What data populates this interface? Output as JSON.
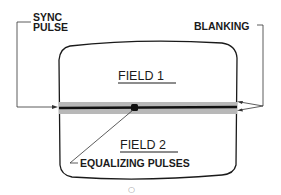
{
  "diagram": {
    "type": "tv-raster-field-diagram",
    "labels": {
      "sync_pulse_line1": "SYNC",
      "sync_pulse_line2": "PULSE",
      "blanking": "BLANKING",
      "field1": "FIELD 1",
      "field2": "FIELD 2",
      "equalizing_pulses": "EQUALIZING PULSES",
      "page_mark": "○"
    },
    "colors": {
      "ink": "#1a1a1a",
      "blanking_band": "#b8b8b8",
      "background": "#ffffff"
    }
  }
}
